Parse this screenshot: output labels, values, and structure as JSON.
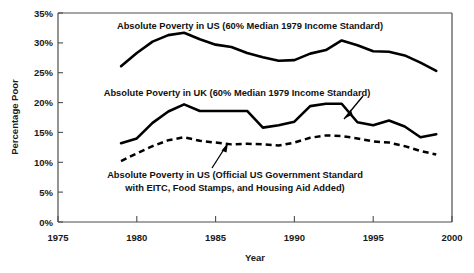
{
  "chart_data": {
    "type": "line",
    "title": "",
    "xlabel": "Year",
    "ylabel": "Percentage Poor",
    "xlim": [
      1975,
      2000
    ],
    "ylim": [
      0,
      35
    ],
    "xticks": [
      "1975",
      "1980",
      "1985",
      "1990",
      "1995",
      "2000"
    ],
    "yticks": [
      "0%",
      "5%",
      "10%",
      "15%",
      "20%",
      "25%",
      "30%",
      "35%"
    ],
    "grid": false,
    "legend_position": "inline-annotations",
    "x": [
      1979,
      1980,
      1981,
      1982,
      1983,
      1984,
      1985,
      1986,
      1987,
      1988,
      1989,
      1990,
      1991,
      1992,
      1993,
      1994,
      1995,
      1996,
      1997,
      1998,
      1999
    ],
    "series": [
      {
        "name": "Absolute Poverty in US (60% Median 1979 Income Standard)",
        "style": "solid",
        "values": [
          26.1,
          28.3,
          30.2,
          31.3,
          31.7,
          30.6,
          29.7,
          29.3,
          28.3,
          27.6,
          27.0,
          27.1,
          28.2,
          28.8,
          30.4,
          29.6,
          28.6,
          28.5,
          27.9,
          26.7,
          25.3
        ]
      },
      {
        "name": "Absolute Poverty in UK (60% Median 1979 Income Standard)",
        "style": "solid",
        "values": [
          13.2,
          14.0,
          16.6,
          18.5,
          19.7,
          18.6,
          18.6,
          18.6,
          18.6,
          15.8,
          16.2,
          16.8,
          19.4,
          19.8,
          19.8,
          16.7,
          16.2,
          17.0,
          16.0,
          14.2,
          14.7
        ]
      },
      {
        "name": "Absolute Poverty in US (Official US Government Standard with EITC, Food Stamps, and Housing Aid Added)",
        "style": "dashed",
        "values": [
          10.2,
          11.5,
          12.7,
          13.7,
          14.2,
          13.6,
          13.3,
          13.0,
          13.1,
          13.0,
          12.8,
          13.3,
          14.1,
          14.5,
          14.4,
          14.0,
          13.5,
          13.3,
          12.7,
          11.9,
          11.3
        ]
      }
    ],
    "annotations": [
      {
        "id": "annot-us-median",
        "text": "Absolute Poverty in US (60% Median 1979 Income Standard)",
        "lines": [
          "Absolute Poverty in US (60% Median 1979 Income Standard)"
        ],
        "has_arrow": false
      },
      {
        "id": "annot-uk-median",
        "text": "Absolute Poverty in UK (60% Median 1979 Income Standard)",
        "lines": [
          "Absolute Poverty in UK (60% Median 1979 Income Standard)"
        ],
        "has_arrow": true
      },
      {
        "id": "annot-us-official",
        "text": "Absolute Poverty in US (Official US Government Standard with EITC, Food Stamps, and Housing Aid Added)",
        "lines": [
          "Absolute Poverty in US (Official US Government Standard",
          "with EITC, Food Stamps, and Housing Aid Added)"
        ],
        "has_arrow": true
      }
    ],
    "colors": {
      "line": "#000000",
      "axis": "#4d4d4d",
      "text": "#1a1a1a",
      "background": "#ffffff"
    }
  },
  "axis": {
    "y_title": "Percentage Poor",
    "x_title": "Year",
    "y_ticks": [
      {
        "label": "35%",
        "value": 35
      },
      {
        "label": "30%",
        "value": 30
      },
      {
        "label": "25%",
        "value": 25
      },
      {
        "label": "20%",
        "value": 20
      },
      {
        "label": "15%",
        "value": 15
      },
      {
        "label": "10%",
        "value": 10
      },
      {
        "label": "5%",
        "value": 5
      },
      {
        "label": "0%",
        "value": 0
      }
    ],
    "x_ticks": [
      {
        "label": "1975",
        "value": 1975
      },
      {
        "label": "1980",
        "value": 1980
      },
      {
        "label": "1985",
        "value": 1985
      },
      {
        "label": "1990",
        "value": 1990
      },
      {
        "label": "1995",
        "value": 1995
      },
      {
        "label": "2000",
        "value": 2000
      }
    ]
  },
  "annotations": {
    "us_median": "Absolute Poverty in US (60% Median 1979 Income Standard)",
    "uk_median": "Absolute Poverty in UK (60% Median 1979 Income Standard)",
    "us_official_line1": "Absolute Poverty in US (Official US Government Standard",
    "us_official_line2": "with EITC, Food Stamps, and Housing Aid Added)"
  }
}
